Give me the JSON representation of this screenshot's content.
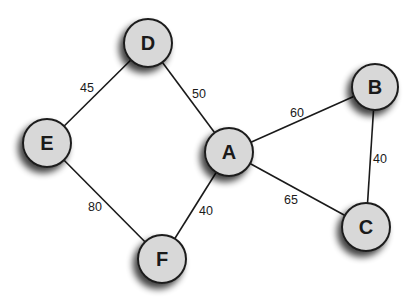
{
  "diagram": {
    "type": "weighted-undirected-graph",
    "nodes": [
      {
        "id": "A",
        "label": "A",
        "x": 229,
        "y": 152,
        "r": 24
      },
      {
        "id": "B",
        "label": "B",
        "x": 375,
        "y": 87,
        "r": 23
      },
      {
        "id": "C",
        "label": "C",
        "x": 366,
        "y": 227,
        "r": 24
      },
      {
        "id": "D",
        "label": "D",
        "x": 148,
        "y": 43,
        "r": 24
      },
      {
        "id": "E",
        "label": "E",
        "x": 47,
        "y": 143,
        "r": 24
      },
      {
        "id": "F",
        "label": "F",
        "x": 162,
        "y": 259,
        "r": 24
      }
    ],
    "edges": [
      {
        "from": "D",
        "to": "E",
        "weight": "45",
        "label_x": 87,
        "label_y": 92
      },
      {
        "from": "D",
        "to": "A",
        "weight": "50",
        "label_x": 199,
        "label_y": 98
      },
      {
        "from": "A",
        "to": "B",
        "weight": "60",
        "label_x": 297,
        "label_y": 117
      },
      {
        "from": "B",
        "to": "C",
        "weight": "40",
        "label_x": 380,
        "label_y": 163
      },
      {
        "from": "A",
        "to": "C",
        "weight": "65",
        "label_x": 291,
        "label_y": 204
      },
      {
        "from": "E",
        "to": "F",
        "weight": "80",
        "label_x": 95,
        "label_y": 211
      },
      {
        "from": "A",
        "to": "F",
        "weight": "40",
        "label_x": 206,
        "label_y": 215
      }
    ],
    "colors": {
      "node_fill": "#d8d8d8",
      "node_stroke": "#1e1e1e",
      "edge": "#1a1a1a",
      "text": "#1a1a1a",
      "background": "#ffffff"
    }
  }
}
